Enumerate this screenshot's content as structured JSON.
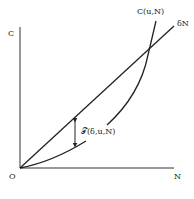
{
  "diagram": {
    "axes": {
      "y_label": "C",
      "x_label": "N",
      "origin_label": "O"
    },
    "curves": [
      {
        "name": "cost-curve",
        "label": "C(u,N)",
        "shape": "convex, starts at origin, crosses line"
      },
      {
        "name": "linear-line",
        "label": "δN",
        "shape": "straight line through origin"
      }
    ],
    "annotation": {
      "label": "𝒯(δ,u,N)",
      "description": "vertical double-arrow gap between δN line and C(u,N) curve"
    },
    "colors": {
      "stroke": "#222222",
      "background": "#ffffff"
    }
  }
}
